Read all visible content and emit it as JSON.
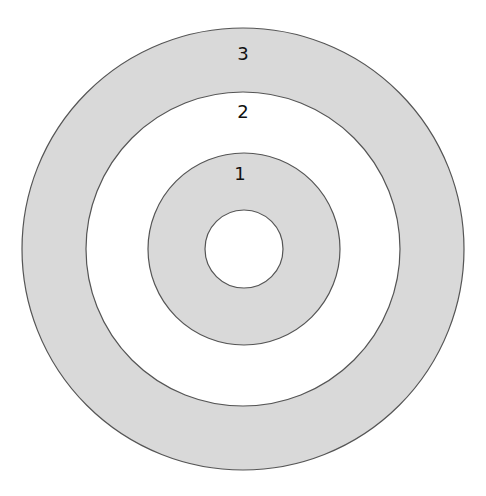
{
  "diagram": {
    "type": "concentric-rings",
    "center": {
      "x": 243,
      "y": 249
    },
    "colors": {
      "ring_fill": "#d9d9d9",
      "gap_fill": "#ffffff",
      "stroke": "#555555"
    },
    "circles": [
      {
        "name": "outer",
        "r": 221,
        "fill": "#d9d9d9"
      },
      {
        "name": "ring-2-gap",
        "r": 157,
        "fill": "#ffffff"
      },
      {
        "name": "ring-1",
        "r": 96,
        "fill": "#d9d9d9"
      },
      {
        "name": "center",
        "r": 39,
        "fill": "#ffffff"
      }
    ],
    "labels": [
      {
        "text": "3",
        "x": 243,
        "y": 60
      },
      {
        "text": "2",
        "x": 243,
        "y": 118
      },
      {
        "text": "1",
        "x": 240,
        "y": 180
      }
    ]
  }
}
